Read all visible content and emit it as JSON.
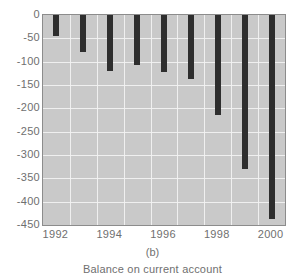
{
  "chart_data": {
    "type": "bar",
    "title": "",
    "panel_label": "(b)",
    "caption": "Balance on current account",
    "xlabel": "",
    "ylabel": "",
    "categories": [
      1992,
      1993,
      1994,
      1995,
      1996,
      1997,
      1998,
      1999,
      2000
    ],
    "values": [
      -45,
      -80,
      -120,
      -108,
      -122,
      -138,
      -215,
      -330,
      -438
    ],
    "series": [
      {
        "name": "Balance on current account",
        "values": [
          -45,
          -80,
          -120,
          -108,
          -122,
          -138,
          -215,
          -330,
          -438
        ]
      }
    ],
    "ylim": [
      -450,
      0
    ],
    "xlim": [
      1991.5,
      2000.5
    ],
    "ytick_labels": [
      "0",
      "-50",
      "-100",
      "-150",
      "-200",
      "-250",
      "-300",
      "-350",
      "-400",
      "-450"
    ],
    "ytick_values": [
      0,
      -50,
      -100,
      -150,
      -200,
      -250,
      -300,
      -350,
      -400,
      -450
    ],
    "xtick_labels": [
      "1992",
      "1994",
      "1996",
      "1998",
      "2000"
    ],
    "xtick_values": [
      1992,
      1994,
      1996,
      1998,
      2000
    ],
    "grid": true,
    "legend": false,
    "colors": {
      "bar": "#2e2e2e",
      "plot_background": "#c9c9c9",
      "gridline": "#f2f2f2",
      "axis_border": "#8c8c8c",
      "text": "#6f6f6f",
      "page_background": "#ffffff"
    }
  }
}
